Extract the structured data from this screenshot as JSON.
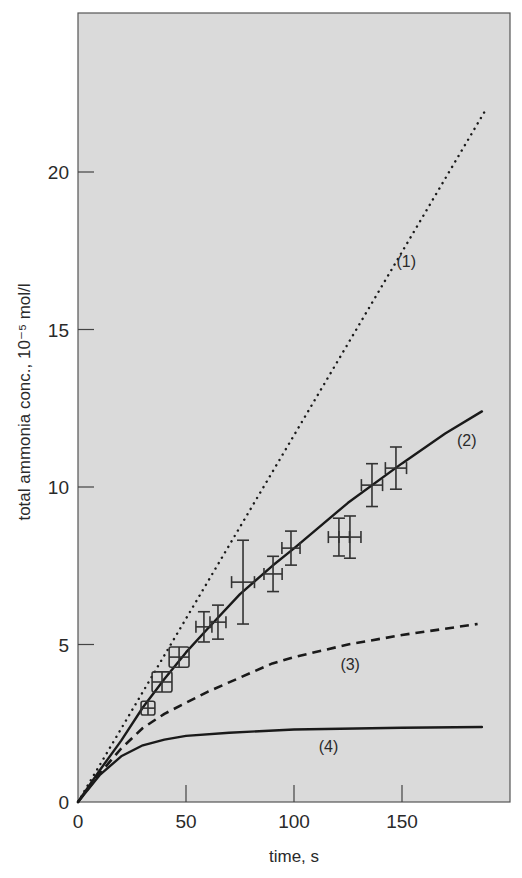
{
  "chart_data": {
    "type": "line",
    "title": "",
    "xlabel": "time, s",
    "ylabel": "total ammonia conc., 10⁻⁵ mol/l",
    "xlim": [
      0,
      200
    ],
    "ylim": [
      0,
      25
    ],
    "x_ticks": [
      0,
      50,
      100,
      150
    ],
    "y_ticks": [
      0,
      5,
      10,
      15,
      20
    ],
    "grid": false,
    "legend": "inline curve labels",
    "background": "#dadada",
    "series": [
      {
        "name": "(1)",
        "style": "dotted",
        "x": [
          0,
          189
        ],
        "y": [
          0,
          22.0
        ],
        "label_pos": [
          152,
          17.0
        ]
      },
      {
        "name": "(2)",
        "style": "solid",
        "x": [
          0,
          10,
          20,
          30,
          40,
          50,
          60,
          75,
          90,
          100,
          125,
          150,
          170,
          187
        ],
        "y": [
          0,
          1.0,
          1.95,
          3.0,
          3.9,
          4.75,
          5.5,
          6.6,
          7.5,
          8.05,
          9.5,
          10.75,
          11.7,
          12.4
        ],
        "label_pos": [
          180,
          11.3
        ]
      },
      {
        "name": "(3)",
        "style": "dashed",
        "x": [
          0,
          10,
          20,
          30,
          40,
          50,
          60,
          75,
          90,
          100,
          125,
          150,
          185
        ],
        "y": [
          0,
          0.9,
          1.7,
          2.35,
          2.8,
          3.15,
          3.5,
          3.95,
          4.4,
          4.6,
          5.0,
          5.3,
          5.65
        ],
        "label_pos": [
          126,
          4.2
        ]
      },
      {
        "name": "(4)",
        "style": "solid",
        "x": [
          0,
          10,
          20,
          30,
          40,
          50,
          70,
          100,
          150,
          187
        ],
        "y": [
          0,
          0.85,
          1.45,
          1.8,
          1.98,
          2.1,
          2.2,
          2.3,
          2.36,
          2.38
        ],
        "label_pos": [
          116,
          1.6
        ]
      },
      {
        "name": "measured",
        "style": "points with error bars",
        "points": [
          {
            "t": 32.4,
            "c": 2.98,
            "dt": 3.2,
            "dc": 0.22,
            "marker": "box"
          },
          {
            "t": 38.9,
            "c": 3.81,
            "dt": 4.6,
            "dc": 0.32,
            "marker": "box"
          },
          {
            "t": 46.8,
            "c": 4.6,
            "dt": 4.6,
            "dc": 0.32,
            "marker": "box"
          },
          {
            "t": 58.3,
            "c": 5.56,
            "dt": 3.7,
            "dc": 0.48,
            "marker": "cross"
          },
          {
            "t": 64.8,
            "c": 5.71,
            "dt": 3.7,
            "dc": 0.54,
            "marker": "cross"
          },
          {
            "t": 76.4,
            "c": 6.98,
            "dt": 5.3,
            "dc": 1.33,
            "marker": "cross"
          },
          {
            "t": 90.3,
            "c": 7.24,
            "dt": 4.2,
            "dc": 0.56,
            "marker": "cross"
          },
          {
            "t": 98.6,
            "c": 8.06,
            "dt": 4.2,
            "dc": 0.54,
            "marker": "cross"
          },
          {
            "t": 120.8,
            "c": 8.41,
            "dt": 4.9,
            "dc": 0.6,
            "marker": "cross"
          },
          {
            "t": 125.9,
            "c": 8.41,
            "dt": 5.1,
            "dc": 0.67,
            "marker": "cross"
          },
          {
            "t": 136.1,
            "c": 10.06,
            "dt": 4.9,
            "dc": 0.68,
            "marker": "cross"
          },
          {
            "t": 147.2,
            "c": 10.6,
            "dt": 4.9,
            "dc": 0.67,
            "marker": "cross"
          }
        ]
      }
    ]
  }
}
